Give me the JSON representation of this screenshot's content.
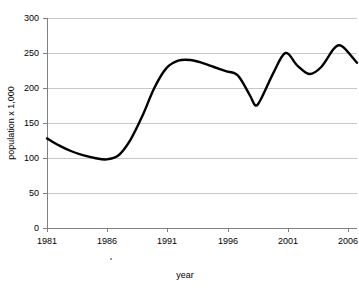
{
  "chart_data": {
    "type": "line",
    "title": "",
    "xlabel": "year",
    "ylabel": "population x 1,000",
    "xlim": [
      1981,
      2007
    ],
    "ylim": [
      0,
      300
    ],
    "grid": true,
    "legend": false,
    "x_ticks": [
      "1981",
      "1986",
      "1991",
      "1996",
      "2001",
      "2006"
    ],
    "x_tick_values": [
      1981,
      1986,
      1991,
      1996,
      2001,
      2006
    ],
    "y_ticks": [
      "0",
      "50",
      "100",
      "150",
      "200",
      "250",
      "300"
    ],
    "y_tick_values": [
      0,
      50,
      100,
      150,
      200,
      250,
      300
    ],
    "series": [
      {
        "name": "population",
        "color": "#000000",
        "x": [
          1981,
          1982,
          1983,
          1984,
          1985,
          1986,
          1987,
          1988,
          1989,
          1990,
          1991,
          1992,
          1993,
          1994,
          1995,
          1996,
          1997,
          1998,
          1998.5,
          1999,
          2000,
          2001,
          2002,
          2003,
          2004,
          2005,
          2005.5,
          2006,
          2007
        ],
        "values": [
          128,
          118,
          110,
          104,
          100,
          98,
          104,
          126,
          160,
          200,
          228,
          239,
          240,
          236,
          230,
          224,
          218,
          190,
          175,
          186,
          222,
          250,
          232,
          220,
          230,
          255,
          261,
          256,
          236
        ]
      }
    ]
  },
  "axis": {
    "y_title": "population x 1,000",
    "x_title": "year"
  }
}
